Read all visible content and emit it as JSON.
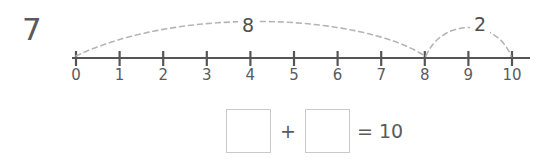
{
  "worksheet": {
    "question_number": "7",
    "background_color": "#ffffff",
    "line_color": "#555555",
    "arc_color": "#b5b5b5",
    "text_color": "#5b5b5b",
    "box_border_color": "#c9c9c9"
  },
  "number_line": {
    "start_value": 0,
    "end_value": 10,
    "ticks": [
      {
        "value": 0,
        "label": "0"
      },
      {
        "value": 1,
        "label": "1"
      },
      {
        "value": 2,
        "label": "2"
      },
      {
        "value": 3,
        "label": "3"
      },
      {
        "value": 4,
        "label": "4"
      },
      {
        "value": 5,
        "label": "5"
      },
      {
        "value": 6,
        "label": "6"
      },
      {
        "value": 7,
        "label": "7"
      },
      {
        "value": 8,
        "label": "8"
      },
      {
        "value": 9,
        "label": "9"
      },
      {
        "value": 10,
        "label": "10"
      }
    ],
    "jumps": [
      {
        "label": "8",
        "from": 0,
        "to": 8,
        "style": "dashed"
      },
      {
        "label": "2",
        "from": 8,
        "to": 10,
        "style": "dashed"
      }
    ]
  },
  "equation": {
    "first_addend": "",
    "operator": "+",
    "second_addend": "",
    "equals_and_sum": "= 10",
    "first_placeholder": "",
    "second_placeholder": ""
  }
}
